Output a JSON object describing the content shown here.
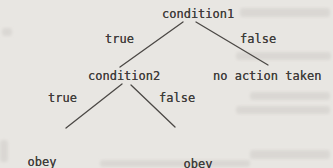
{
  "diagram": {
    "type": "decision-tree",
    "colors": {
      "background": "#e8e6e2",
      "text": "#3e3c3a",
      "line": "#4b4845"
    },
    "nodes": [
      {
        "id": "condition1",
        "lines": [
          "condition1"
        ]
      },
      {
        "id": "condition2",
        "lines": [
          "condition2"
        ]
      },
      {
        "id": "no-action-taken",
        "lines": [
          "no action taken"
        ]
      },
      {
        "id": "obey-statementa",
        "lines": [
          "obey",
          "statementa"
        ]
      },
      {
        "id": "obey-statementb",
        "lines": [
          "obey",
          "statementb"
        ]
      }
    ],
    "edges": [
      {
        "from": "condition1",
        "to": "condition2",
        "label": "true"
      },
      {
        "from": "condition1",
        "to": "no-action-taken",
        "label": "false"
      },
      {
        "from": "condition2",
        "to": "obey-statementa",
        "label": "true"
      },
      {
        "from": "condition2",
        "to": "obey-statementb",
        "label": "false"
      }
    ]
  }
}
